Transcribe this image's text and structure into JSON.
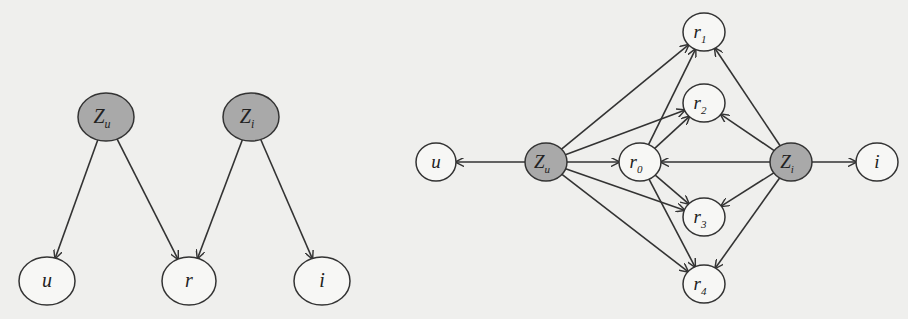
{
  "colors": {
    "background": "#efefed",
    "latent_fill": "#a9a9a9",
    "observed_fill": "#f7f7f5",
    "stroke": "#333333"
  },
  "diagrams": [
    {
      "name": "left-model",
      "nodes": [
        {
          "id": "Zu",
          "base": "Z",
          "sub": "u",
          "latent": true,
          "cx": 106,
          "cy": 117,
          "rx": 28,
          "ry": 24
        },
        {
          "id": "Zi",
          "base": "Z",
          "sub": "i",
          "latent": true,
          "cx": 251,
          "cy": 117,
          "rx": 28,
          "ry": 24
        },
        {
          "id": "u",
          "base": "u",
          "sub": "",
          "latent": false,
          "cx": 47,
          "cy": 281,
          "rx": 28,
          "ry": 24
        },
        {
          "id": "r",
          "base": "r",
          "sub": "",
          "latent": false,
          "cx": 189,
          "cy": 281,
          "rx": 27,
          "ry": 24
        },
        {
          "id": "i",
          "base": "i",
          "sub": "",
          "latent": false,
          "cx": 322,
          "cy": 281,
          "rx": 28,
          "ry": 24
        }
      ],
      "edges": [
        {
          "from": "Zu",
          "to": "u"
        },
        {
          "from": "Zu",
          "to": "r"
        },
        {
          "from": "Zi",
          "to": "r"
        },
        {
          "from": "Zi",
          "to": "i"
        }
      ]
    },
    {
      "name": "right-model",
      "nodes": [
        {
          "id": "u",
          "base": "u",
          "sub": "",
          "latent": false,
          "cx": 436,
          "cy": 162,
          "rx": 20,
          "ry": 19
        },
        {
          "id": "Zu",
          "base": "Z",
          "sub": "u",
          "latent": true,
          "cx": 546,
          "cy": 162,
          "rx": 21,
          "ry": 19
        },
        {
          "id": "r0",
          "base": "r",
          "sub": "0",
          "latent": false,
          "cx": 640,
          "cy": 162,
          "rx": 21,
          "ry": 19
        },
        {
          "id": "r1",
          "base": "r",
          "sub": "1",
          "latent": false,
          "cx": 704,
          "cy": 32,
          "rx": 21,
          "ry": 19
        },
        {
          "id": "r2",
          "base": "r",
          "sub": "2",
          "latent": false,
          "cx": 704,
          "cy": 103,
          "rx": 21,
          "ry": 19
        },
        {
          "id": "r3",
          "base": "r",
          "sub": "3",
          "latent": false,
          "cx": 704,
          "cy": 217,
          "rx": 21,
          "ry": 19
        },
        {
          "id": "r4",
          "base": "r",
          "sub": "4",
          "latent": false,
          "cx": 704,
          "cy": 284,
          "rx": 21,
          "ry": 19
        },
        {
          "id": "Zi",
          "base": "Z",
          "sub": "i",
          "latent": true,
          "cx": 791,
          "cy": 162,
          "rx": 21,
          "ry": 19
        },
        {
          "id": "i",
          "base": "i",
          "sub": "",
          "latent": false,
          "cx": 877,
          "cy": 162,
          "rx": 21,
          "ry": 19
        }
      ],
      "edges": [
        {
          "from": "Zu",
          "to": "u"
        },
        {
          "from": "Zu",
          "to": "r0"
        },
        {
          "from": "Zu",
          "to": "r1"
        },
        {
          "from": "Zu",
          "to": "r2"
        },
        {
          "from": "Zu",
          "to": "r3"
        },
        {
          "from": "Zu",
          "to": "r4"
        },
        {
          "from": "r0",
          "to": "r1"
        },
        {
          "from": "r0",
          "to": "r2"
        },
        {
          "from": "r0",
          "to": "r3"
        },
        {
          "from": "r0",
          "to": "r4"
        },
        {
          "from": "Zi",
          "to": "r0"
        },
        {
          "from": "Zi",
          "to": "r1"
        },
        {
          "from": "Zi",
          "to": "r2"
        },
        {
          "from": "Zi",
          "to": "r3"
        },
        {
          "from": "Zi",
          "to": "r4"
        },
        {
          "from": "Zi",
          "to": "i"
        }
      ]
    }
  ]
}
